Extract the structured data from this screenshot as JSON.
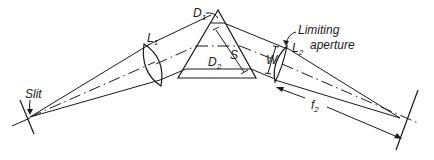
{
  "diagram": {
    "labels": {
      "slit": "Slit",
      "l1": "L",
      "l1_sub": "1",
      "l2": "L",
      "l2_sub": "2",
      "d1": "D",
      "d1_sub": "1",
      "d2": "D",
      "d2_sub": "2",
      "s": "S",
      "w": "W",
      "f2": "f",
      "f2_sub": "2",
      "limiting_line1": "Limiting",
      "limiting_line2": "aperture"
    },
    "colors": {
      "ink": "#1a1a1a",
      "background": "#ffffff"
    }
  }
}
